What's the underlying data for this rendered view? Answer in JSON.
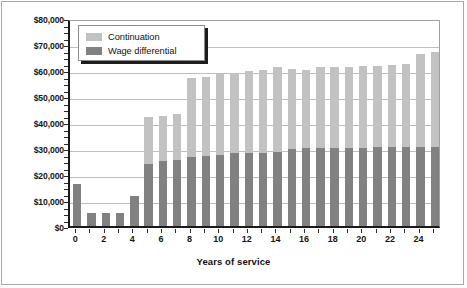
{
  "chart_data": {
    "type": "bar",
    "title": "",
    "xlabel": "Years of service",
    "ylabel": "",
    "stacked": true,
    "grid": true,
    "legend_position": "top-left",
    "ylim": [
      0,
      80000
    ],
    "ytick_labels": [
      "$80,000",
      "$70,000",
      "$60,000",
      "$50,000",
      "$40,000",
      "$30,000",
      "$20,000",
      "$10,000",
      "$0"
    ],
    "ytick_values": [
      80000,
      70000,
      60000,
      50000,
      40000,
      30000,
      20000,
      10000,
      0
    ],
    "categories": [
      0,
      1,
      2,
      3,
      4,
      5,
      6,
      7,
      8,
      9,
      10,
      11,
      12,
      13,
      14,
      15,
      16,
      17,
      18,
      19,
      20,
      21,
      22,
      23,
      24,
      25
    ],
    "xtick_labels": [
      "0",
      "2",
      "4",
      "6",
      "8",
      "10",
      "12",
      "14",
      "16",
      "18",
      "20",
      "22",
      "24"
    ],
    "xtick_values": [
      0,
      2,
      4,
      6,
      8,
      10,
      12,
      14,
      16,
      18,
      20,
      22,
      24
    ],
    "series": [
      {
        "name": "Wage differential",
        "color": "#818181",
        "values": [
          16000,
          5000,
          5000,
          5000,
          11500,
          24000,
          25000,
          25500,
          26500,
          27000,
          27500,
          28000,
          28000,
          28000,
          28500,
          29500,
          30000,
          30000,
          30000,
          30000,
          30000,
          30500,
          30500,
          30500,
          30500,
          30500
        ]
      },
      {
        "name": "Continuation",
        "color": "#c2c2c2",
        "values": [
          0,
          0,
          0,
          0,
          0,
          18000,
          17500,
          17500,
          30500,
          30500,
          31000,
          31000,
          31500,
          32000,
          32500,
          31000,
          30000,
          31000,
          31000,
          31000,
          31500,
          31000,
          31500,
          32000,
          35500,
          36500
        ]
      }
    ],
    "totals": [
      16000,
      5000,
      5000,
      5000,
      11500,
      42000,
      42500,
      43000,
      57000,
      57500,
      58500,
      59000,
      59500,
      60000,
      61000,
      60500,
      60000,
      61000,
      61000,
      61000,
      61500,
      61500,
      62000,
      62500,
      66000,
      67000
    ]
  },
  "legend": {
    "items": [
      {
        "label": "Continuation",
        "swatch": "light-gray-swatch"
      },
      {
        "label": "Wage differential",
        "swatch": "dark-gray-swatch"
      }
    ]
  },
  "colors": {
    "continuation": "#c2c2c2",
    "wage_differential": "#818181",
    "axis": "#1a1a1a",
    "grid": "#bdbdbd",
    "background": "#ffffff"
  }
}
